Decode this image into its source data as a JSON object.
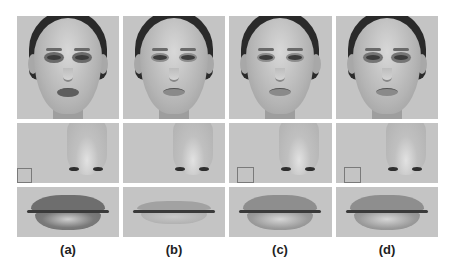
{
  "figure": {
    "columns": [
      {
        "id": "a",
        "label": "(a)",
        "face_desc": "Asian female face with dark eye makeup and dark lips"
      },
      {
        "id": "b",
        "label": "(b)",
        "face_desc": "Caucasian female face, no makeup"
      },
      {
        "id": "c",
        "label": "(c)",
        "face_desc": "Caucasian female face, light makeup"
      },
      {
        "id": "d",
        "label": "(d)",
        "face_desc": "Caucasian female face, transferred makeup"
      }
    ],
    "rows": [
      "face",
      "nose",
      "lips"
    ],
    "colors": {
      "background": "#ffffff",
      "panel_gray": "#c4c4c4",
      "label_text": "#222222"
    }
  }
}
